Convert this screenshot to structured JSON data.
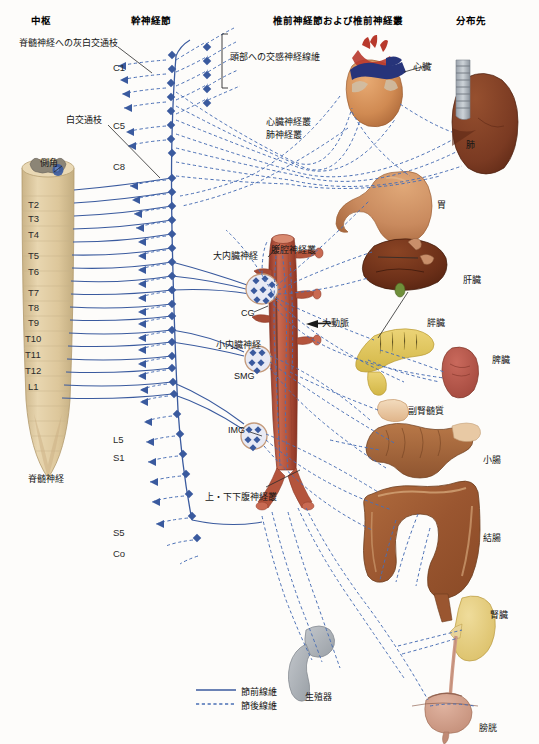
{
  "diagram": {
    "colors": {
      "preganglionic": "#3a5a9e",
      "postganglionic": "#4a6fb5",
      "cord": "#ddc79b",
      "gray_matter": "#8c8576",
      "aorta": "#b4543c",
      "heart_muscle": "#d79055",
      "artery_red": "#b8392c",
      "vein_blue": "#27347a",
      "lung": "#7a3a22",
      "stomach": "#c98a5e",
      "liver": "#6b2f18",
      "pancreas": "#e0c45a",
      "spleen": "#b7564a",
      "adrenal": "#edc9a0",
      "intestine": "#a35f38",
      "colon": "#a05a33",
      "kidney": "#e3cb7e",
      "bladder": "#cf9a86",
      "gonad": "#a9adb2",
      "label_text": "#161616"
    }
  },
  "headers": [
    {
      "id": "center",
      "label": "中枢"
    },
    {
      "id": "trunk-ganglia",
      "label": "幹神経節"
    },
    {
      "id": "prevertebral",
      "label": "椎前神経節および椎前神経叢"
    },
    {
      "id": "targets",
      "label": "分布先"
    }
  ],
  "annotations": [
    {
      "id": "gray-white-rami",
      "label": "脊髄神経への灰白交通枝"
    },
    {
      "id": "head-sympathetic-fibers",
      "label": "頭部への交感神経線維"
    },
    {
      "id": "white-rami",
      "label": "白交通枝"
    },
    {
      "id": "lateral-horn",
      "label": "側角"
    },
    {
      "id": "cardiac-plexus",
      "label": "心臓神経叢"
    },
    {
      "id": "pulmonary-plexus",
      "label": "肺神経叢"
    },
    {
      "id": "greater-splanchnic-nerve",
      "label": "大内臓神経"
    },
    {
      "id": "celiac-plexus",
      "label": "腹腔神経叢"
    },
    {
      "id": "lesser-splanchnic-nerve",
      "label": "小内臓神経"
    },
    {
      "id": "aorta",
      "label": "大動脈"
    },
    {
      "id": "celiac-ganglion",
      "label": "CG"
    },
    {
      "id": "superior-mesenteric-ganglion",
      "label": "SMG"
    },
    {
      "id": "inferior-mesenteric-ganglion",
      "label": "IMG"
    },
    {
      "id": "hypogastric-plexus",
      "label": "上・下下腹神経叢"
    },
    {
      "id": "spinal-nerve",
      "label": "脊髄神経"
    }
  ],
  "cord_segments": [
    {
      "id": "c1",
      "label": "C1"
    },
    {
      "id": "c5",
      "label": "C5"
    },
    {
      "id": "c8",
      "label": "C8"
    },
    {
      "id": "t2",
      "label": "T2"
    },
    {
      "id": "t3",
      "label": "T3"
    },
    {
      "id": "t4",
      "label": "T4"
    },
    {
      "id": "t5",
      "label": "T5"
    },
    {
      "id": "t6",
      "label": "T6"
    },
    {
      "id": "t7",
      "label": "T7"
    },
    {
      "id": "t8",
      "label": "T8"
    },
    {
      "id": "t9",
      "label": "T9"
    },
    {
      "id": "t10",
      "label": "T10"
    },
    {
      "id": "t11",
      "label": "T11"
    },
    {
      "id": "t12",
      "label": "T12"
    },
    {
      "id": "l1",
      "label": "L1"
    },
    {
      "id": "l5",
      "label": "L5"
    },
    {
      "id": "s1",
      "label": "S1"
    },
    {
      "id": "s5",
      "label": "S5"
    },
    {
      "id": "co",
      "label": "Co"
    }
  ],
  "organs": [
    {
      "id": "heart",
      "label": "心臓"
    },
    {
      "id": "lung",
      "label": "肺"
    },
    {
      "id": "stomach",
      "label": "胃"
    },
    {
      "id": "liver",
      "label": "肝臓"
    },
    {
      "id": "pancreas",
      "label": "膵臓"
    },
    {
      "id": "spleen",
      "label": "脾臓"
    },
    {
      "id": "adrenal-medulla",
      "label": "副腎髄質"
    },
    {
      "id": "small-intestine",
      "label": "小腸"
    },
    {
      "id": "colon",
      "label": "結腸"
    },
    {
      "id": "kidney",
      "label": "腎臓"
    },
    {
      "id": "gonad",
      "label": "生殖器"
    },
    {
      "id": "bladder",
      "label": "膀胱"
    }
  ],
  "legend": {
    "items": [
      {
        "id": "preganglionic-fiber",
        "label": "節前線維",
        "style": "solid"
      },
      {
        "id": "postganglionic-fiber",
        "label": "節後線維",
        "style": "dashed"
      }
    ]
  }
}
